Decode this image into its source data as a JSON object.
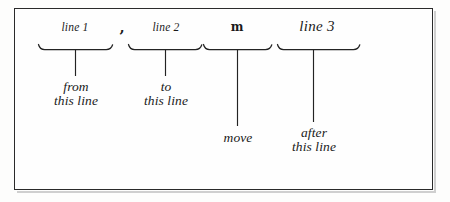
{
  "figure": {
    "kind": "syntax-diagram",
    "caption": "",
    "frame_color": "#2a2a2a",
    "ink_color": "#232323",
    "background_color": "#fefefe"
  },
  "syntax": {
    "tokens": [
      {
        "id": "line1",
        "text": "line 1",
        "style": "italic-small"
      },
      {
        "id": "comma",
        "text": ",",
        "style": "bold-literal"
      },
      {
        "id": "line2",
        "text": "line 2",
        "style": "italic-small"
      },
      {
        "id": "m",
        "text": "m",
        "style": "bold-literal"
      },
      {
        "id": "line3",
        "text": "line 3",
        "style": "italic-large"
      }
    ]
  },
  "annotations": [
    {
      "id": "from",
      "lines": [
        "from",
        "this line"
      ]
    },
    {
      "id": "to",
      "lines": [
        "to",
        "this line"
      ]
    },
    {
      "id": "move",
      "lines": [
        "move"
      ]
    },
    {
      "id": "after",
      "lines": [
        "after",
        "this line"
      ]
    }
  ],
  "groups": [
    {
      "id": "group-line1",
      "label": "line 1",
      "annotation": "from this line"
    },
    {
      "id": "group-line2",
      "label": "line 2",
      "annotation": "to this line"
    },
    {
      "id": "group-m",
      "label": "m",
      "annotation": "move"
    },
    {
      "id": "group-line3",
      "label": "line 3",
      "annotation": "after this line"
    }
  ]
}
